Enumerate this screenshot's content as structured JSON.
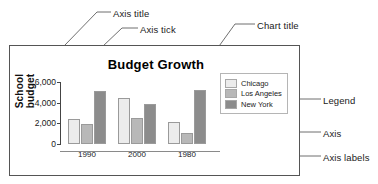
{
  "annotations": [
    {
      "id": "axis-title",
      "label": "Axis title"
    },
    {
      "id": "axis-tick",
      "label": "Axis tick"
    },
    {
      "id": "chart-title",
      "label": "Chart title"
    },
    {
      "id": "legend",
      "label": "Legend"
    },
    {
      "id": "axis",
      "label": "Axis"
    },
    {
      "id": "axis-labels",
      "label": "Axis labels"
    }
  ],
  "chart_data": {
    "type": "bar",
    "title": "Budget Growth",
    "xlabel": "",
    "ylabel": "School budget",
    "categories": [
      "1990",
      "2000",
      "1980"
    ],
    "series": [
      {
        "name": "Chicago",
        "color": "#ececec",
        "values": [
          2400,
          4500,
          2150
        ]
      },
      {
        "name": "Los Angeles",
        "color": "#b8b8b8",
        "values": [
          1900,
          2550,
          1050
        ]
      },
      {
        "name": "New York",
        "color": "#8c8c8c",
        "values": [
          5100,
          3900,
          5250
        ]
      }
    ],
    "ylim": [
      0,
      6000
    ],
    "yticks": [
      0,
      2000,
      4000,
      6000
    ],
    "ytick_labels": [
      "0",
      "2,000",
      "4,000",
      "6,000"
    ],
    "grid": false,
    "legend_position": "right-inside"
  },
  "colors": {
    "frame": "#555555",
    "axis": "#444444",
    "text": "#222222"
  }
}
